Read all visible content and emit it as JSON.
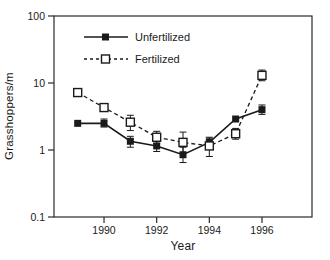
{
  "figure": {
    "background": "#ffffff",
    "frame_color": "#2a2a2a",
    "series_color": "#1a1a1a"
  },
  "chart_data": {
    "type": "line",
    "title": "",
    "xlabel": "Year",
    "ylabel": "Grasshoppers/m",
    "y_scale": "log",
    "xlim": [
      1988.1,
      1997.9
    ],
    "ylim": [
      0.1,
      100
    ],
    "x_ticks": [
      1990,
      1992,
      1994,
      1996
    ],
    "y_ticks": [
      100,
      10,
      1,
      0.1
    ],
    "grid": false,
    "legend_position": "upper-left-inside",
    "error_bars": true,
    "categories": [
      1989,
      1990,
      1991,
      1992,
      1993,
      1994,
      1995,
      1996
    ],
    "series": [
      {
        "name": "Unfertilized",
        "marker": "filled-square",
        "line_style": "solid",
        "color": "#1a1a1a",
        "x": [
          1989,
          1990,
          1991,
          1992,
          1993,
          1994,
          1995,
          1996
        ],
        "y": [
          2.5,
          2.5,
          1.35,
          1.15,
          0.85,
          1.3,
          2.9,
          4.0
        ],
        "err_lo": [
          null,
          2.2,
          1.1,
          0.95,
          0.65,
          1.05,
          null,
          3.4
        ],
        "err_hi": [
          null,
          2.9,
          1.6,
          1.35,
          1.1,
          1.55,
          null,
          4.7
        ]
      },
      {
        "name": "Fertilized",
        "marker": "open-square",
        "line_style": "dashed",
        "color": "#1a1a1a",
        "x": [
          1989,
          1990,
          1991,
          1992,
          1993,
          1994,
          1995,
          1996
        ],
        "y": [
          7.2,
          4.3,
          2.6,
          1.55,
          1.3,
          1.15,
          1.75,
          13.0
        ],
        "err_lo": [
          null,
          null,
          1.95,
          1.25,
          0.9,
          0.8,
          1.45,
          10.8
        ],
        "err_hi": [
          null,
          null,
          3.3,
          1.9,
          1.85,
          1.5,
          2.1,
          15.6
        ]
      }
    ]
  }
}
